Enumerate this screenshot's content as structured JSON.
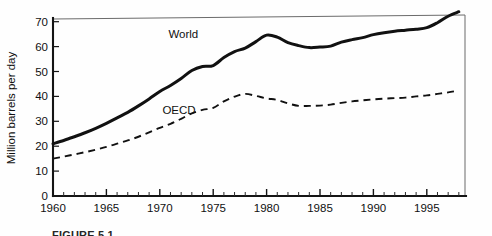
{
  "figure": {
    "caption": "FIGURE 5.1"
  },
  "chart_data": {
    "type": "line",
    "title": "",
    "subtitle": "",
    "xlabel": "",
    "ylabel": "Million barrels per day",
    "xlim": [
      1960,
      1998
    ],
    "ylim": [
      0,
      75
    ],
    "grid": false,
    "legend_position": "inline-labels",
    "y_ticks": [
      0,
      10,
      20,
      30,
      40,
      50,
      60,
      70
    ],
    "y_tick_labels": [
      "0",
      "10",
      "20",
      "30",
      "40",
      "50",
      "60",
      "70"
    ],
    "x_ticks_major": [
      1960,
      1965,
      1970,
      1975,
      1980,
      1985,
      1990,
      1995
    ],
    "x_tick_labels": [
      "1960",
      "1965",
      "1970",
      "1975",
      "1980",
      "1985",
      "1990",
      "1995"
    ],
    "x_ticks_minor_step": 1,
    "x": [
      1960,
      1961,
      1962,
      1963,
      1964,
      1965,
      1966,
      1967,
      1968,
      1969,
      1970,
      1971,
      1972,
      1973,
      1974,
      1975,
      1976,
      1977,
      1978,
      1979,
      1980,
      1981,
      1982,
      1983,
      1984,
      1985,
      1986,
      1987,
      1988,
      1989,
      1990,
      1991,
      1992,
      1993,
      1994,
      1995,
      1996,
      1997,
      1998
    ],
    "series": [
      {
        "name": "World",
        "style": "solid",
        "label_text": "World",
        "label_x": 1972.2,
        "label_y": 63.5,
        "values": [
          21.0,
          22.3,
          23.8,
          25.4,
          27.2,
          29.2,
          31.4,
          33.6,
          36.2,
          39.0,
          42.0,
          44.4,
          47.2,
          50.4,
          52.0,
          52.4,
          55.6,
          58.0,
          59.4,
          62.0,
          64.6,
          63.8,
          61.6,
          60.4,
          59.6,
          59.8,
          60.2,
          61.8,
          62.8,
          63.6,
          64.8,
          65.6,
          66.2,
          66.6,
          67.0,
          67.6,
          69.6,
          72.2,
          74.0
        ]
      },
      {
        "name": "OECD",
        "style": "dashed",
        "label_text": "OECD",
        "label_x": 1971.8,
        "label_y": 33.0,
        "values": [
          15.0,
          15.8,
          16.7,
          17.6,
          18.6,
          19.7,
          21.0,
          22.3,
          23.8,
          25.6,
          27.4,
          29.0,
          31.0,
          33.2,
          34.6,
          35.4,
          38.0,
          39.9,
          41.0,
          40.2,
          39.2,
          38.6,
          37.2,
          36.2,
          36.2,
          36.3,
          36.7,
          37.4,
          38.0,
          38.4,
          38.8,
          39.1,
          39.3,
          39.5,
          40.0,
          40.4,
          41.0,
          41.6,
          42.4
        ]
      }
    ]
  }
}
